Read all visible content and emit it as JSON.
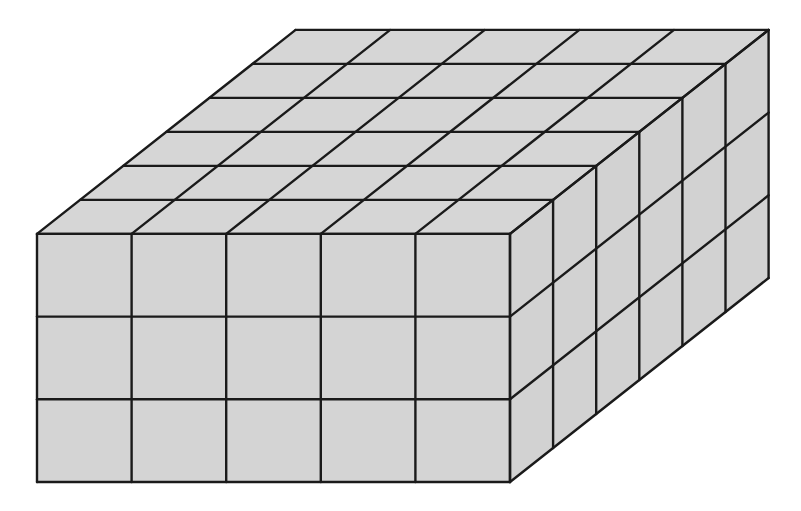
{
  "diagram": {
    "type": "rectangular-prism-of-unit-cubes",
    "dimensions": {
      "length_cubes": 5,
      "depth_cubes": 6,
      "height_cubes": 3
    },
    "total_unit_cubes": 90,
    "colors": {
      "face_fill": "#d4d4d4",
      "top_fill": "#d6d6d6",
      "side_fill": "#d2d2d2",
      "edge_stroke": "#1a1a1a",
      "background": "#ffffff"
    },
    "geometry": {
      "front_origin": [
        37,
        482
      ],
      "unit_width": 94.6,
      "unit_height": 82.7,
      "depth_step": [
        43.1,
        -34.0
      ]
    }
  }
}
